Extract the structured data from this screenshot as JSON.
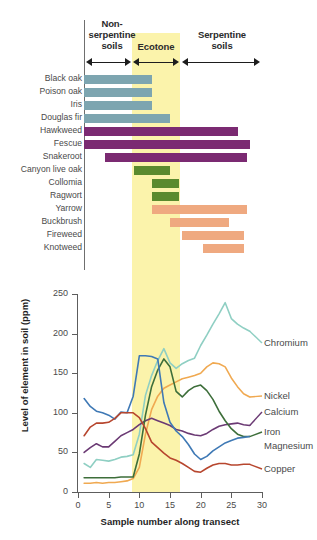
{
  "figure": {
    "zones": [
      {
        "name": "non-serpentine",
        "label": "Non-\nserpentine\nsoils"
      },
      {
        "name": "ecotone",
        "label": "Ecotone"
      },
      {
        "name": "serpentine",
        "label": "Serpentine\nsoils"
      }
    ],
    "zone_labels": {
      "non_serpentine": "Non-\nserpentine\nsoils",
      "ecotone": "Ecotone",
      "serpentine": "Serpentine\nsoils"
    },
    "colors": {
      "ecotone_band": "#fbf3ab",
      "blue": "#7da5b0",
      "purple": "#7b2a72",
      "green": "#5a8a2e",
      "salmon": "#efa980",
      "chromium": "#8fcfc3",
      "nickel": "#f0a951",
      "calcium": "#6b3a74",
      "iron": "#3d6e3a",
      "magnesium": "#3f79b5",
      "copper": "#b7462e"
    }
  },
  "chart_data": [
    {
      "type": "bar",
      "name": "species-distribution-ranges",
      "title": "",
      "xlabel": "",
      "ylabel": "",
      "xlim": [
        0,
        30
      ],
      "ecotone_range": [
        8.5,
        16.0
      ],
      "categories": [
        "Black oak",
        "Poison oak",
        "Iris",
        "Douglas fir",
        "Hawkweed",
        "Fescue",
        "Snakeroot",
        "Canyon live oak",
        "Collomia",
        "Ragwort",
        "Yarrow",
        "Buckbrush",
        "Fireweed",
        "Knotweed"
      ],
      "bars": [
        {
          "species": "Black oak",
          "start": 0.0,
          "end": 11.5,
          "color": "#7da5b0"
        },
        {
          "species": "Poison oak",
          "start": 0.0,
          "end": 11.5,
          "color": "#7da5b0"
        },
        {
          "species": "Iris",
          "start": 0.0,
          "end": 11.5,
          "color": "#7da5b0"
        },
        {
          "species": "Douglas fir",
          "start": 0.0,
          "end": 14.5,
          "color": "#7da5b0"
        },
        {
          "species": "Hawkweed",
          "start": 0.0,
          "end": 26.0,
          "color": "#7b2a72"
        },
        {
          "species": "Fescue",
          "start": 0.0,
          "end": 28.0,
          "color": "#7b2a72"
        },
        {
          "species": "Snakeroot",
          "start": 3.5,
          "end": 27.5,
          "color": "#7b2a72"
        },
        {
          "species": "Canyon live oak",
          "start": 8.5,
          "end": 14.5,
          "color": "#5a8a2e"
        },
        {
          "species": "Collomia",
          "start": 11.5,
          "end": 16.0,
          "color": "#5a8a2e"
        },
        {
          "species": "Ragwort",
          "start": 11.5,
          "end": 16.0,
          "color": "#5a8a2e"
        },
        {
          "species": "Yarrow",
          "start": 11.5,
          "end": 27.5,
          "color": "#efa980"
        },
        {
          "species": "Buckbrush",
          "start": 14.5,
          "end": 24.5,
          "color": "#efa980"
        },
        {
          "species": "Fireweed",
          "start": 16.5,
          "end": 27.0,
          "color": "#efa980"
        },
        {
          "species": "Knotweed",
          "start": 20.0,
          "end": 27.0,
          "color": "#efa980"
        }
      ]
    },
    {
      "type": "line",
      "name": "soil-element-levels",
      "title": "",
      "xlabel": "Sample number along transect",
      "ylabel": "Level of element in soil (ppm)",
      "xlim": [
        0,
        30
      ],
      "ylim": [
        0,
        250
      ],
      "xticks": [
        0,
        5,
        10,
        15,
        20,
        25,
        30
      ],
      "yticks": [
        0,
        50,
        100,
        150,
        200,
        250
      ],
      "grid": false,
      "legend_position": "right-inline",
      "ecotone_range": [
        8.5,
        16.0
      ],
      "x": [
        1,
        2,
        3,
        4,
        5,
        6,
        7,
        8,
        9,
        10,
        11,
        12,
        13,
        14,
        15,
        16,
        17,
        18,
        19,
        20,
        21,
        22,
        23,
        24,
        25,
        26,
        27,
        28
      ],
      "series": [
        {
          "name": "Chromium",
          "color": "#8fcfc3",
          "values": [
            36,
            31,
            41,
            40,
            39,
            41,
            44,
            45,
            47,
            73,
            122,
            147,
            166,
            181,
            163,
            156,
            162,
            166,
            169,
            185,
            198,
            212,
            225,
            239,
            219,
            212,
            207,
            203
          ]
        },
        {
          "name": "Nickel",
          "color": "#f0a951",
          "values": [
            11,
            11,
            12,
            11,
            12,
            12,
            13,
            14,
            17,
            31,
            73,
            104,
            121,
            131,
            135,
            139,
            143,
            145,
            147,
            150,
            158,
            163,
            162,
            158,
            144,
            133,
            124,
            120
          ]
        },
        {
          "name": "Calcium",
          "color": "#6b3a74",
          "values": [
            50,
            56,
            61,
            57,
            57,
            64,
            71,
            75,
            79,
            85,
            90,
            93,
            90,
            87,
            84,
            79,
            77,
            74,
            72,
            71,
            74,
            79,
            83,
            85,
            86,
            87,
            85,
            84
          ]
        },
        {
          "name": "Iron",
          "color": "#3d6e3a",
          "values": [
            18,
            18,
            18,
            18,
            18,
            18,
            19,
            19,
            19,
            48,
            97,
            133,
            154,
            168,
            158,
            127,
            120,
            128,
            133,
            135,
            128,
            117,
            102,
            90,
            80,
            73,
            70,
            70
          ]
        },
        {
          "name": "Magnesium",
          "color": "#3f79b5",
          "values": [
            118,
            108,
            102,
            100,
            97,
            92,
            101,
            100,
            121,
            172,
            172,
            171,
            168,
            113,
            88,
            77,
            70,
            60,
            48,
            41,
            45,
            52,
            57,
            62,
            65,
            68,
            69,
            70
          ]
        },
        {
          "name": "Copper",
          "color": "#b7462e",
          "values": [
            71,
            82,
            87,
            87,
            88,
            93,
            100,
            100,
            100,
            94,
            80,
            63,
            56,
            49,
            43,
            40,
            36,
            31,
            26,
            25,
            30,
            34,
            36,
            36,
            34,
            34,
            35,
            35
          ]
        }
      ]
    }
  ]
}
